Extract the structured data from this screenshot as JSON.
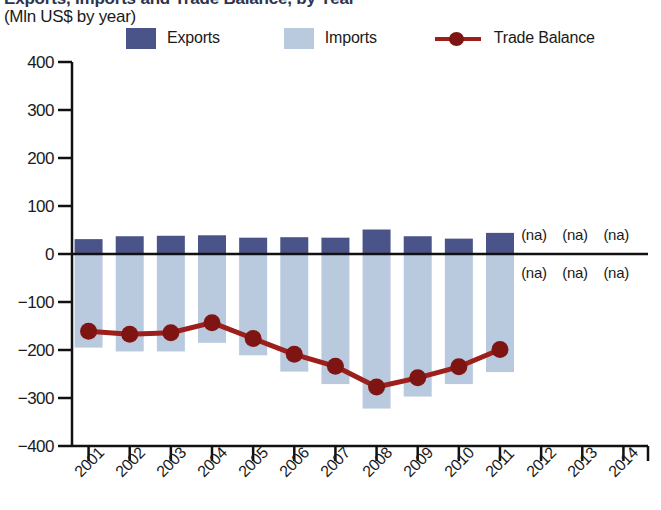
{
  "title": "Exports, Imports and Trade Balance, by Year",
  "subtitle": "(Mln US$ by year)",
  "legend": {
    "exports": {
      "label": "Exports",
      "color": "#4a5489",
      "icon": "square-swatch"
    },
    "imports": {
      "label": "Imports",
      "color": "#b9cade",
      "icon": "square-swatch"
    },
    "balance": {
      "label": "Trade Balance",
      "color": "#9c1f1b",
      "icon": "line-marker"
    }
  },
  "chart_data": {
    "type": "bar",
    "title": "Exports, Imports and Trade Balance, by Year",
    "subtitle": "(Mln US$ by year)",
    "xlabel": "",
    "ylabel": "Mln US$",
    "ylim": [
      -400,
      400
    ],
    "yticks": [
      400,
      300,
      200,
      100,
      0,
      -100,
      -200,
      -300,
      -400
    ],
    "ytick_labels": [
      "400",
      "300",
      "200",
      "100",
      "0",
      "−100",
      "−200",
      "−300",
      "−400"
    ],
    "grid": false,
    "legend_position": "top",
    "categories": [
      "2001",
      "2002",
      "2003",
      "2004",
      "2005",
      "2006",
      "2007",
      "2008",
      "2009",
      "2010",
      "2011",
      "2012",
      "2013",
      "2014"
    ],
    "series": [
      {
        "name": "Exports",
        "type": "bar",
        "color": "#4a5489",
        "values": [
          31,
          37,
          38,
          39,
          34,
          35,
          34,
          51,
          37,
          32,
          44,
          null,
          null,
          null
        ]
      },
      {
        "name": "Imports",
        "type": "bar",
        "color": "#b9cade",
        "values": [
          -195,
          -203,
          -203,
          -185,
          -211,
          -245,
          -271,
          -322,
          -297,
          -271,
          -246,
          null,
          null,
          null
        ]
      },
      {
        "name": "Trade Balance",
        "type": "line",
        "color": "#9c1f1b",
        "values": [
          -161,
          -167,
          -164,
          -143,
          -176,
          -209,
          -234,
          -277,
          -258,
          -235,
          -199,
          null,
          null,
          null
        ]
      }
    ],
    "missing_labels": {
      "text": "(na)",
      "years": [
        "2012",
        "2013",
        "2014"
      ],
      "rows": [
        "above-zero",
        "below-zero"
      ]
    }
  },
  "axis": {
    "ytick_0": "400",
    "ytick_1": "300",
    "ytick_2": "200",
    "ytick_3": "100",
    "ytick_4": "0",
    "ytick_5": "−100",
    "ytick_6": "−200",
    "ytick_7": "−300",
    "ytick_8": "−400"
  },
  "na_text": "(na)"
}
